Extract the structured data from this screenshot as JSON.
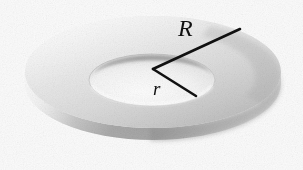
{
  "figure": {
    "kind": "geometry-illustration",
    "background_color": "#fbfbfb",
    "labels": [
      {
        "id": "outer-radius",
        "text": "R",
        "style": "italic-serif",
        "meaning": "outer radius",
        "color": "#111111",
        "font_size_px": 24
      },
      {
        "id": "inner-radius",
        "text": "r",
        "style": "italic-serif",
        "meaning": "inner radius",
        "color": "#111111",
        "font_size_px": 19
      }
    ],
    "leader_lines": [
      {
        "id": "outer-radius-line",
        "from": [
          153,
          69
        ],
        "to": [
          240,
          29
        ],
        "color": "#111111",
        "width_px": 2.6,
        "label": "R"
      },
      {
        "id": "inner-radius-line",
        "from": [
          153,
          69
        ],
        "to": [
          196,
          96
        ],
        "color": "#111111",
        "width_px": 2.6,
        "label": "r"
      }
    ],
    "geometry": {
      "center": [
        153,
        69
      ],
      "outer_ellipse": {
        "cx": 153,
        "cy": 72,
        "rx": 128,
        "ry": 56
      },
      "inner_ellipse": {
        "cx": 152,
        "cy": 80,
        "rx": 63,
        "ry": 26
      },
      "thickness_px": 26
    },
    "palette": {
      "top_face_light": "#eeeeee",
      "top_face_mid": "#d7d7d7",
      "top_face_dark": "#bdbdbd",
      "rim_light": "#e4e4e4",
      "rim_dark": "#9a9a9a",
      "hole_interior": "#fafafa",
      "hole_wall_shadow": "#8e8e8e",
      "outline": "#111111"
    }
  }
}
